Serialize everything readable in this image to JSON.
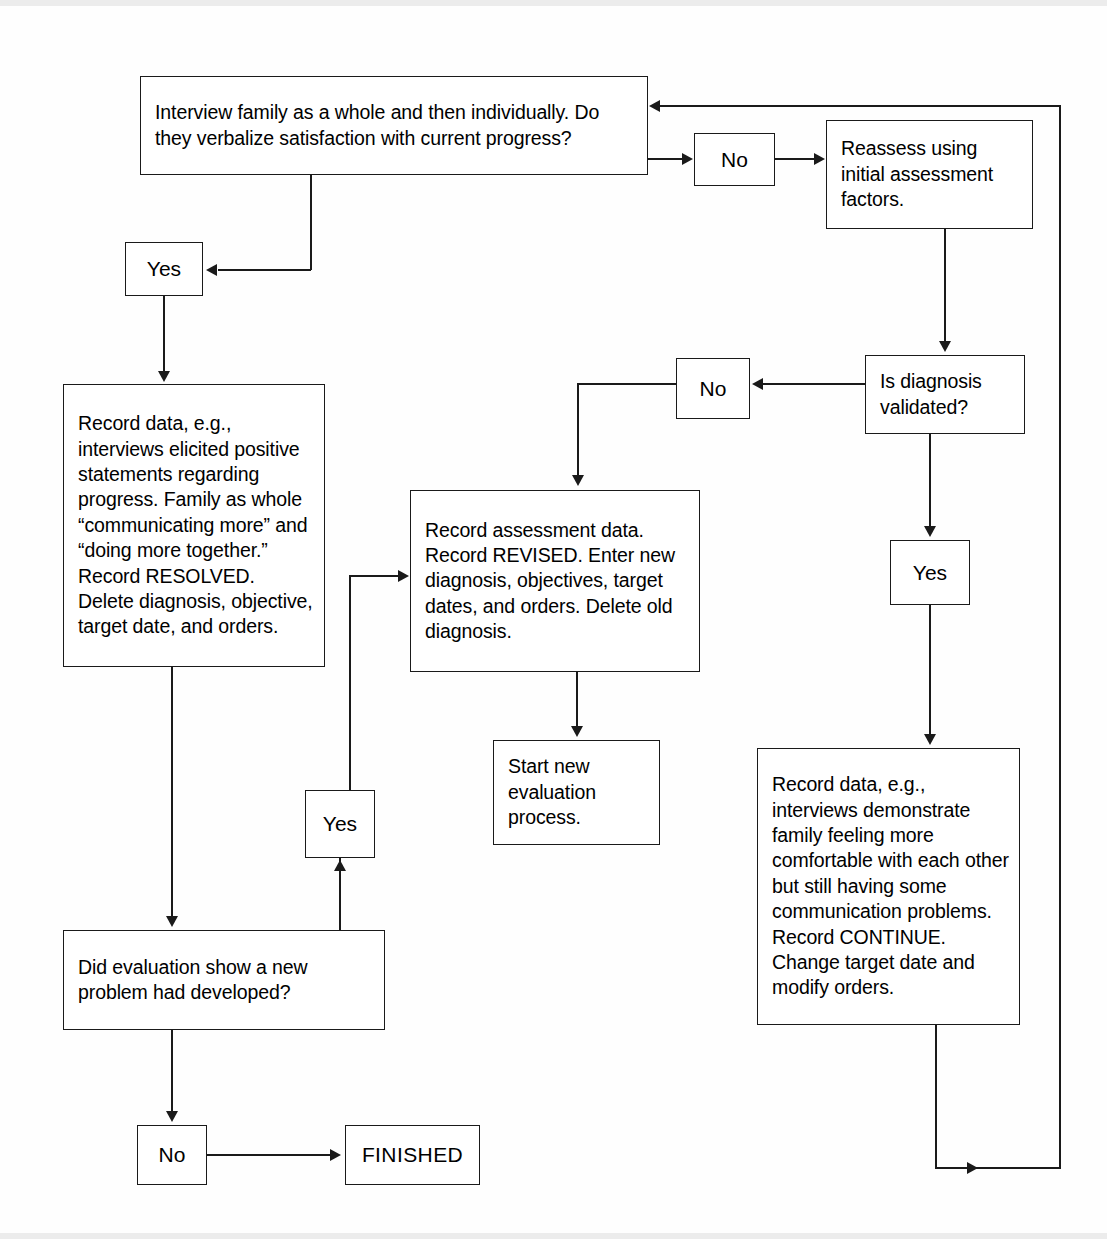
{
  "diagram": {
    "nodes": {
      "interview": "Interview family as a whole and then individually. Do they verbalize satisfaction with current progress?",
      "no_top": "No",
      "reassess": "Reassess using initial assessment factors.",
      "yes_left": "Yes",
      "is_validated": "Is diagnosis validated?",
      "no_validated": "No",
      "record_resolved": "Record data, e.g., interviews elicited positive statements regarding progress. Family as whole “communicating more” and “doing more together.” Record RESOLVED. Delete diagnosis, objective, target date, and orders.",
      "record_revised": "Record assessment data. Record REVISED. Enter new diagnosis, objectives, target dates, and orders. Delete old diagnosis.",
      "yes_validated": "Yes",
      "yes_new_problem": "Yes",
      "start_new": "Start new evaluation process.",
      "record_continue": "Record data, e.g., interviews demonstrate family feeling more comfortable with each other but still having some communication problems. Record CONTINUE. Change target date and modify orders.",
      "new_problem_q": "Did evaluation show a new problem had developed?",
      "no_bottom": "No",
      "finished": "FINISHED"
    },
    "edges": [
      {
        "from": "interview",
        "to": "no_top",
        "label": ""
      },
      {
        "from": "no_top",
        "to": "reassess",
        "label": ""
      },
      {
        "from": "interview",
        "to": "yes_left",
        "label": ""
      },
      {
        "from": "yes_left",
        "to": "record_resolved",
        "label": ""
      },
      {
        "from": "reassess",
        "to": "is_validated",
        "label": ""
      },
      {
        "from": "is_validated",
        "to": "no_validated",
        "label": ""
      },
      {
        "from": "no_validated",
        "to": "record_revised",
        "label": ""
      },
      {
        "from": "is_validated",
        "to": "yes_validated",
        "label": ""
      },
      {
        "from": "yes_validated",
        "to": "record_continue",
        "label": ""
      },
      {
        "from": "record_revised",
        "to": "start_new",
        "label": ""
      },
      {
        "from": "record_resolved",
        "to": "new_problem_q",
        "label": ""
      },
      {
        "from": "new_problem_q",
        "to": "yes_new_problem",
        "label": ""
      },
      {
        "from": "yes_new_problem",
        "to": "record_revised",
        "label": ""
      },
      {
        "from": "new_problem_q",
        "to": "no_bottom",
        "label": ""
      },
      {
        "from": "no_bottom",
        "to": "finished",
        "label": ""
      },
      {
        "from": "record_continue",
        "to": "interview",
        "label": ""
      }
    ],
    "colors": {
      "stroke": "#1a1a1a",
      "fill": "#ffffff",
      "page": "#fefefe"
    }
  }
}
